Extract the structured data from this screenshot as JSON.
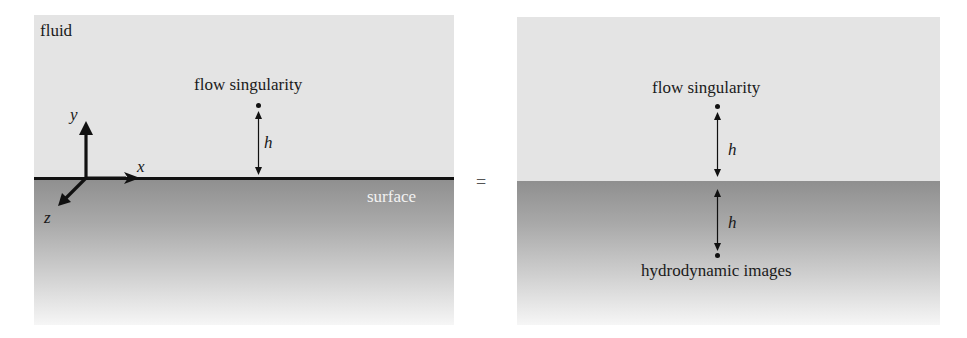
{
  "figure": {
    "equals_sign": "=",
    "left_panel": {
      "fluid_label": "fluid",
      "singularity_label": "flow singularity",
      "distance_label": "h",
      "surface_label": "surface",
      "axes": {
        "x": "x",
        "y": "y",
        "z": "z"
      }
    },
    "right_panel": {
      "singularity_label": "flow singularity",
      "upper_distance_label": "h",
      "lower_distance_label": "h",
      "images_label": "hydrodynamic images"
    },
    "colors": {
      "fluid": "#e4e4e4",
      "surface_top": "#8f8f8f",
      "surface_bottom": "#f6f6f6",
      "lines": "#111111",
      "surface_text": "#f2f2f2"
    }
  }
}
